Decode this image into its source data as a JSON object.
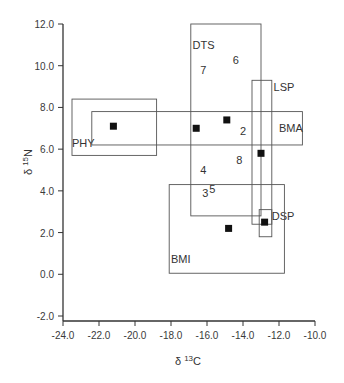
{
  "chart_data": {
    "type": "scatter",
    "title": "",
    "xlabel": "δ 13C",
    "ylabel": "δ 15N",
    "xlim": [
      -24.0,
      -10.0
    ],
    "ylim": [
      -2.0,
      12.0
    ],
    "x_ticks": [
      "-24.0",
      "-22.0",
      "-20.0",
      "-18.0",
      "-16.0",
      "-14.0",
      "-12.0",
      "-10.0"
    ],
    "y_ticks": [
      "12.0",
      "10.0",
      "8.0",
      "6.0",
      "4.0",
      "2.0",
      "0.0",
      "-2.0"
    ],
    "grid": false,
    "legend": null,
    "boxes": [
      {
        "name": "PHY",
        "x": [
          -23.5,
          -18.8
        ],
        "y": [
          5.7,
          8.4
        ],
        "label_pos": [
          -23.5,
          6.1
        ]
      },
      {
        "name": "BMA",
        "x": [
          -22.4,
          -10.7
        ],
        "y": [
          6.2,
          7.8
        ],
        "label_pos": [
          -12.0,
          6.8
        ]
      },
      {
        "name": "DTS",
        "x": [
          -16.9,
          -13.0
        ],
        "y": [
          2.8,
          12.0
        ],
        "label_pos": [
          -16.8,
          10.8
        ]
      },
      {
        "name": "LSP",
        "x": [
          -13.5,
          -12.4
        ],
        "y": [
          2.4,
          9.3
        ],
        "label_pos": [
          -12.3,
          8.8
        ]
      },
      {
        "name": "DSP",
        "x": [
          -13.1,
          -12.4
        ],
        "y": [
          1.8,
          3.1
        ],
        "label_pos": [
          -12.4,
          2.6
        ]
      },
      {
        "name": "BMI",
        "x": [
          -18.1,
          -11.7
        ],
        "y": [
          0.05,
          4.3
        ],
        "label_pos": [
          -18.0,
          0.55
        ]
      }
    ],
    "points": [
      {
        "x": -21.2,
        "y": 7.1
      },
      {
        "x": -16.6,
        "y": 7.0
      },
      {
        "x": -14.9,
        "y": 7.4
      },
      {
        "x": -13.0,
        "y": 5.8
      },
      {
        "x": -12.8,
        "y": 2.5
      },
      {
        "x": -14.8,
        "y": 2.2
      }
    ],
    "annotations": [
      {
        "text": "7",
        "x": -16.2,
        "y": 9.6
      },
      {
        "text": "6",
        "x": -14.4,
        "y": 10.1
      },
      {
        "text": "2",
        "x": -14.0,
        "y": 6.7
      },
      {
        "text": "8",
        "x": -14.2,
        "y": 5.3
      },
      {
        "text": "4",
        "x": -16.2,
        "y": 4.8
      },
      {
        "text": "3",
        "x": -16.1,
        "y": 3.7
      },
      {
        "text": "5",
        "x": -15.7,
        "y": 3.9
      }
    ]
  }
}
